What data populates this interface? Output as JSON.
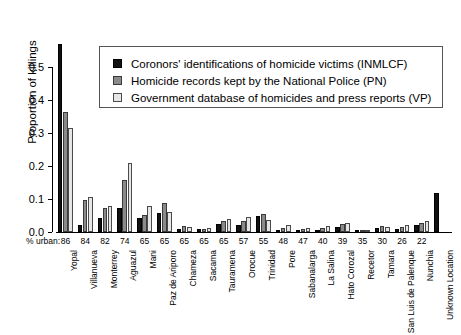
{
  "chart_data": {
    "type": "bar",
    "title": "",
    "subtitle": "",
    "xlabel": "",
    "ylabel": "Proportion of killings",
    "ylim": [
      0.0,
      0.6
    ],
    "yticks": [
      "0.0",
      "0.1",
      "0.2",
      "0.3",
      "0.4",
      "0.5"
    ],
    "ytick_values": [
      0.0,
      0.1,
      0.2,
      0.3,
      0.4,
      0.5
    ],
    "grid": false,
    "legend_position": "top-center",
    "categories": [
      "Yopal",
      "Villanueva",
      "Monterrey",
      "Aguazul",
      "Mani",
      "Paz de Ariporo",
      "Chameza",
      "Sacama",
      "Tauramena",
      "Orocue",
      "Trinidad",
      "Pore",
      "Sabanalarga",
      "La Salina",
      "Hato Corozal",
      "Recetor",
      "Tamara",
      "San Luis de Palenque",
      "Nunchia",
      "Unknown Location"
    ],
    "secondary_axis": {
      "label": "% urban:",
      "values": [
        86,
        84,
        82,
        74,
        65,
        65,
        65,
        65,
        65,
        57,
        55,
        48,
        47,
        40,
        39,
        35,
        30,
        26,
        22,
        ""
      ]
    },
    "series": [
      {
        "name": "Coronors' identifications of homicide victims (INMLCF)",
        "key": "INMLCF",
        "color": "#111111",
        "values": [
          0.57,
          0.022,
          0.041,
          0.073,
          0.043,
          0.057,
          0.01,
          0.008,
          0.024,
          0.02,
          0.048,
          0.004,
          0.007,
          0.004,
          0.014,
          0.003,
          0.012,
          0.01,
          0.021,
          0.118
        ]
      },
      {
        "name": "Homicide records kept by the National Police (PN)",
        "key": "PN",
        "color": "#8a8a8a",
        "values": [
          0.365,
          0.097,
          0.072,
          0.158,
          0.052,
          0.088,
          0.017,
          0.009,
          0.032,
          0.033,
          0.055,
          0.012,
          0.01,
          0.012,
          0.024,
          0.004,
          0.019,
          0.014,
          0.026,
          0.0
        ]
      },
      {
        "name": "Government database of homicides and press reports (VP)",
        "key": "VP",
        "color": "#e6e6e6",
        "values": [
          0.315,
          0.105,
          0.078,
          0.21,
          0.08,
          0.062,
          0.016,
          0.013,
          0.038,
          0.047,
          0.036,
          0.02,
          0.012,
          0.018,
          0.028,
          0.003,
          0.014,
          0.022,
          0.032,
          0.0
        ]
      }
    ]
  },
  "legend": {
    "items": [
      {
        "swatch": "black-square-swatch",
        "label": "Coronors' identifications of homicide victims (INMLCF)"
      },
      {
        "swatch": "gray-square-swatch",
        "label": "Homicide records kept by the National Police (PN)"
      },
      {
        "swatch": "light-square-swatch",
        "label": "Government database of homicides and press reports (VP)"
      }
    ]
  }
}
